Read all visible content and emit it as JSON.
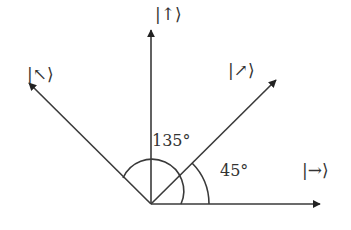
{
  "diagram": {
    "colors": {
      "line": "#3a3a3a",
      "text": "#333333"
    },
    "vectors": [
      {
        "label": "|↑⟩",
        "name": "up"
      },
      {
        "label": "|↖⟩",
        "name": "up-left"
      },
      {
        "label": "|↗⟩",
        "name": "up-right"
      },
      {
        "label": "|→⟩",
        "name": "right"
      }
    ],
    "angles": [
      {
        "label": "135°",
        "value": 135
      },
      {
        "label": "45°",
        "value": 45
      }
    ]
  }
}
